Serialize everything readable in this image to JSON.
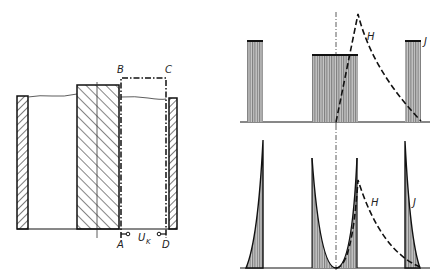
{
  "figure": {
    "left_panel": {
      "description": "Cross-section of capacitor/winding with integration path",
      "labels": {
        "B": "B",
        "C": "C",
        "A": "A",
        "D": "D",
        "voltage": "U",
        "voltage_sub": "K"
      }
    },
    "top_right_panel": {
      "description": "Field distribution, rectangular bars",
      "curve_labels": {
        "H": "H",
        "J": "J"
      }
    },
    "bottom_right_panel": {
      "description": "Field distribution with skin effect spikes",
      "curve_labels": {
        "H": "H",
        "J": "J"
      }
    },
    "colors": {
      "ink": "#1a1a1a",
      "hatch_fill": "#888888",
      "background": "#ffffff"
    }
  }
}
